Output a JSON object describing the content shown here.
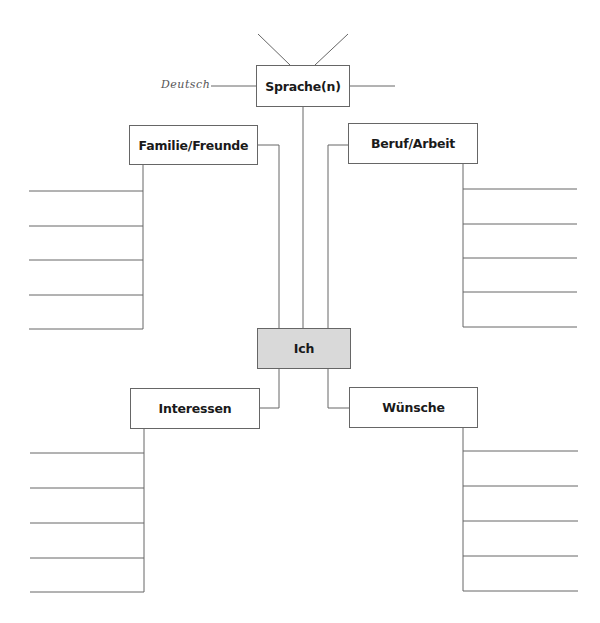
{
  "diagram": {
    "center": {
      "label": "Ich",
      "fill": "#d9d9d9"
    },
    "nodes": {
      "sprache": {
        "label": "Sprache(n)"
      },
      "familie": {
        "label": "Familie/Freunde"
      },
      "beruf": {
        "label": "Beruf/Arbeit"
      },
      "interessen": {
        "label": "Interessen"
      },
      "wuensche": {
        "label": "Wünsche"
      }
    },
    "handwritten": {
      "sprache_entry_1": "Deutsch"
    },
    "answer_lines_per_branch": 5,
    "line_color": "#666666"
  }
}
